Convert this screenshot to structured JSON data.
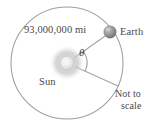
{
  "figure": {
    "title_alt": "Earth orbiting the Sun with central angle theta",
    "labels": {
      "distance": "93,000,000 mi",
      "earth": "Earth",
      "sun": "Sun",
      "angle": "θ",
      "not_to_scale_line1": "Not to",
      "not_to_scale_line2": "scale"
    },
    "colors": {
      "background": "#ffffff",
      "orbit_stroke": "#9a9a9a",
      "radius_stroke": "#a2a2a2",
      "arc_stroke": "#8e8e8e",
      "sun_core": "#e2e2e2",
      "sun_glow": "#c9c9c9",
      "earth_body": "#9b9b9b",
      "earth_shadow": "#6f6f6f",
      "text": "#4a4a4a"
    },
    "geometry": {
      "orbit_center_x": 67,
      "orbit_center_y": 63,
      "orbit_radius": 56,
      "earth_x": 110,
      "earth_y": 32,
      "earth_radius": 6,
      "sun_radius": 7,
      "angle_arc_radius": 20,
      "lower_radius_endpoint_x": 118,
      "lower_radius_endpoint_y": 86
    }
  }
}
